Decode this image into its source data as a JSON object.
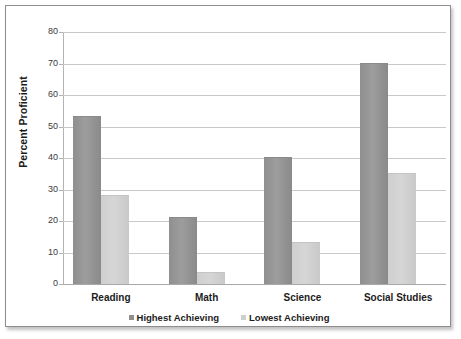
{
  "chart_data": {
    "type": "bar",
    "title": "",
    "subtitle": "",
    "xlabel": "",
    "ylabel": "Percent Proficient",
    "ylim": [
      0,
      80
    ],
    "y_tick_step": 10,
    "y_ticks": [
      80,
      70,
      60,
      50,
      40,
      30,
      20,
      10,
      0
    ],
    "grid": true,
    "legend_position": "bottom",
    "categories": [
      "Reading",
      "Math",
      "Science",
      "Social Studies"
    ],
    "series": [
      {
        "name": "Highest Achieving",
        "color": "#8f8f8f",
        "values": [
          53,
          21,
          40,
          70
        ]
      },
      {
        "name": "Lowest Achieving",
        "color": "#cfcfcf",
        "values": [
          28,
          3.5,
          13,
          35
        ]
      }
    ]
  },
  "frame": {
    "border_color": "#8d8d8d",
    "background": "#ffffff"
  }
}
